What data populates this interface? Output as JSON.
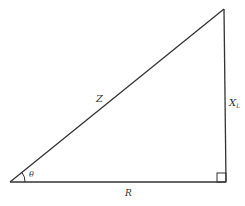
{
  "diagram": {
    "type": "right-triangle",
    "labels": {
      "hypotenuse": "Z",
      "vertical_side": "X",
      "vertical_side_subscript": "L",
      "horizontal_side": "R",
      "angle": "θ"
    },
    "colors": {
      "stroke": "#333333",
      "background": "#ffffff"
    }
  }
}
